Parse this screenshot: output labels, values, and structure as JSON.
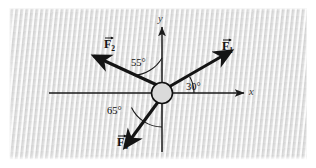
{
  "figure": {
    "kind": "free-body-force-diagram",
    "background_color": "#e6e6e6",
    "page_color": "#ffffff",
    "line_color": "#1a1a1a",
    "hub_fill_color": "#d9d9d9"
  },
  "axes": {
    "x_label": "x",
    "y_label": "y",
    "origin": {
      "x": 162,
      "y": 93
    }
  },
  "hub": {
    "name": "pin-joint",
    "radius": 11
  },
  "vectors": [
    {
      "id": "F1",
      "label_base": "F",
      "label_sub": "1",
      "angle_deg": 30,
      "angle_reference": "positive-x-axis",
      "direction": "up-right",
      "label_x": 222,
      "label_y": 40
    },
    {
      "id": "F2",
      "label_base": "F",
      "label_sub": "2",
      "angle_deg": 55,
      "angle_reference": "positive-y-axis",
      "direction": "up-left",
      "label_x": 104,
      "label_y": 38
    },
    {
      "id": "F3",
      "label_base": "F",
      "label_sub": "3",
      "angle_deg": 65,
      "angle_reference": "negative-y-axis",
      "direction": "down-left",
      "label_x": 117,
      "label_y": 136
    }
  ],
  "angle_arcs": [
    {
      "id": "arc-30",
      "text": "30°",
      "label_x": 186,
      "label_y": 82
    },
    {
      "id": "arc-55",
      "text": "55°",
      "label_x": 131,
      "label_y": 58
    },
    {
      "id": "arc-65",
      "text": "65°",
      "label_x": 107,
      "label_y": 106
    }
  ]
}
